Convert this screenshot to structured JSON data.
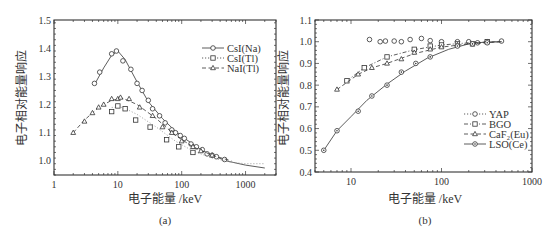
{
  "chart_data": [
    {
      "type": "line",
      "panel_label": "(a)",
      "title": "",
      "xlabel": "电子能量 /keV",
      "ylabel": "电子相对能量响应",
      "xscale": "log",
      "xlim": [
        1,
        3000
      ],
      "ylim": [
        0.95,
        1.5
      ],
      "xticks": [
        "1",
        "10",
        "100",
        "1000"
      ],
      "yticks": [
        "1.0",
        "1.1",
        "1.2",
        "1.3",
        "1.4",
        "1.5"
      ],
      "grid": false,
      "legend_position": "upper right",
      "series": [
        {
          "name": "CsI(Na)",
          "marker": "circle",
          "line": "solid",
          "x": [
            4.3,
            5.2,
            8,
            9.5,
            12,
            16,
            20,
            24,
            30,
            35,
            45,
            55,
            70,
            80,
            95,
            110,
            140,
            170,
            210,
            250,
            300,
            350,
            470
          ],
          "y": [
            1.275,
            1.315,
            1.38,
            1.39,
            1.355,
            1.325,
            1.275,
            1.25,
            1.215,
            1.185,
            1.16,
            1.135,
            1.11,
            1.1,
            1.09,
            1.08,
            1.06,
            1.05,
            1.04,
            1.025,
            1.02,
            1.015,
            1.005
          ],
          "curve_x": [
            4.3,
            6,
            8,
            10,
            13,
            20,
            30,
            50,
            80,
            120,
            200,
            300,
            500,
            1000,
            2000
          ],
          "curve_y": [
            1.27,
            1.33,
            1.375,
            1.39,
            1.36,
            1.28,
            1.21,
            1.15,
            1.105,
            1.075,
            1.04,
            1.02,
            1.0,
            0.985,
            0.975
          ]
        },
        {
          "name": "CsI(Tl)",
          "marker": "square",
          "line": "dotted",
          "x": [
            8,
            10,
            13,
            19,
            32,
            58,
            90,
            150
          ],
          "y": [
            1.175,
            1.195,
            1.185,
            1.145,
            1.12,
            1.075,
            1.05,
            1.03
          ],
          "curve_x": [
            8,
            12,
            20,
            40,
            80,
            150,
            300,
            600,
            1000,
            2000
          ],
          "curve_y": [
            1.19,
            1.19,
            1.165,
            1.12,
            1.07,
            1.035,
            1.01,
            0.995,
            0.99,
            0.99
          ]
        },
        {
          "name": "NaI(Tl)",
          "marker": "triangle",
          "line": "dashed",
          "x": [
            2,
            3,
            4,
            5,
            6,
            8,
            10,
            11,
            15,
            22,
            35,
            50,
            70,
            100,
            150,
            200,
            300
          ],
          "y": [
            1.1,
            1.14,
            1.17,
            1.19,
            1.2,
            1.22,
            1.22,
            1.225,
            1.22,
            1.19,
            1.16,
            1.12,
            1.1,
            1.07,
            1.05,
            1.035,
            1.02
          ],
          "curve_x": [
            2,
            3,
            5,
            8,
            12,
            20,
            40,
            80,
            150,
            300,
            600
          ],
          "curve_y": [
            1.1,
            1.145,
            1.19,
            1.215,
            1.222,
            1.2,
            1.15,
            1.09,
            1.05,
            1.02,
            1.0
          ]
        }
      ]
    },
    {
      "type": "line",
      "panel_label": "(b)",
      "title": "",
      "xlabel": "电子能量 /keV",
      "ylabel": "电子相对能量响应",
      "xscale": "log",
      "xlim": [
        4,
        1000
      ],
      "ylim": [
        0.4,
        1.1
      ],
      "xticks": [
        "10",
        "100",
        "1000"
      ],
      "yticks": [
        "0.4",
        "0.5",
        "0.6",
        "0.7",
        "0.8",
        "0.9",
        "1.0",
        "1.1"
      ],
      "grid": false,
      "legend_position": "lower right",
      "series": [
        {
          "name": "YAP",
          "marker": "circle",
          "line": "dotted",
          "x": [
            16,
            21,
            24,
            30,
            36,
            45,
            60,
            75,
            100,
            150,
            200,
            250,
            320,
            460
          ],
          "y": [
            1.01,
            1.0,
            1.003,
            1.003,
            1.0,
            1.01,
            1.015,
            1.005,
            1.0,
            1.0,
            1.0,
            0.995,
            1.0,
            1.003
          ]
        },
        {
          "name": "BGO",
          "marker": "square",
          "line": "dash-dot",
          "x": [
            9,
            14,
            25,
            50,
            75,
            100,
            150,
            220,
            320
          ],
          "y": [
            0.82,
            0.88,
            0.93,
            0.965,
            0.98,
            0.985,
            0.99,
            0.99,
            1.0
          ],
          "curve_x": [
            9,
            14,
            25,
            50,
            100,
            200,
            460
          ],
          "curve_y": [
            0.82,
            0.88,
            0.93,
            0.963,
            0.985,
            0.995,
            1.0
          ]
        },
        {
          "name": "CaF₂(Eu)",
          "marker": "triangle",
          "line": "dashed",
          "x": [
            7,
            12,
            17,
            25,
            36,
            50,
            75,
            100,
            150
          ],
          "y": [
            0.78,
            0.85,
            0.88,
            0.9,
            0.92,
            0.95,
            0.965,
            0.975,
            0.985
          ],
          "curve_x": [
            7,
            12,
            17,
            25,
            50,
            100,
            200,
            460
          ],
          "curve_y": [
            0.78,
            0.85,
            0.88,
            0.9,
            0.945,
            0.975,
            0.99,
            1.0
          ]
        },
        {
          "name": "LSO(Ce)",
          "marker": "circle-dot",
          "line": "solid",
          "x": [
            5,
            7,
            12,
            17,
            25,
            36,
            52,
            75,
            150,
            220,
            320
          ],
          "y": [
            0.5,
            0.59,
            0.68,
            0.75,
            0.8,
            0.86,
            0.9,
            0.93,
            0.98,
            0.99,
            0.995
          ],
          "curve_x": [
            5,
            7,
            10,
            15,
            25,
            40,
            70,
            120,
            200,
            300,
            460
          ],
          "curve_y": [
            0.5,
            0.59,
            0.655,
            0.73,
            0.805,
            0.865,
            0.925,
            0.965,
            0.99,
            0.998,
            1.0
          ]
        }
      ]
    }
  ],
  "labels": {
    "panel_a": "(a)",
    "panel_b": "(b)",
    "xlabel_a": "电子能量 /keV",
    "xlabel_b": "电子能量 /keV",
    "ylabel_a": "电子相对能量响应",
    "ylabel_b": "电子相对能量响应"
  }
}
